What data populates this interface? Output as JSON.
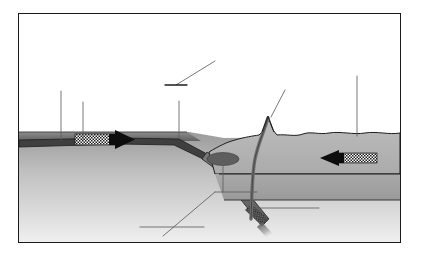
{
  "figure": {
    "number_label": "Fig 27",
    "title": "A destructive plate boundary",
    "frame_color": "#1a1a1a",
    "background_color": "#ffffff"
  },
  "diagram": {
    "name": "destructive-plate-boundary-cross-section",
    "type": "geological-cross-section",
    "palette": {
      "mantle_top": "#9d9d9d",
      "mantle_bottom": "#e8e8e8",
      "ocean_water": "#6f6f6f",
      "oceanic_crust": "#4a4a4a",
      "continental_crust": "#b4b4b4",
      "continental_crust_lower": "#a2a2a2",
      "slab": "#6b6b6b",
      "magma_chamber": "#5e5e5e",
      "conduit": "#6a6a6a",
      "arrow_black": "#0d0d0d",
      "arrow_hatch": "#2a2a2a",
      "leader_line": "#5a5a5a",
      "outline": "#1d1d1d"
    },
    "features": [
      {
        "id": "ocean-water",
        "label": "ocean water layer",
        "description": "dark narrow band of sea water over the oceanic plate on the left"
      },
      {
        "id": "oceanic-plate",
        "label": "oceanic plate",
        "description": "thin dark oceanic crust sloping down to the right toward the trench"
      },
      {
        "id": "ocean-trench",
        "label": "ocean trench",
        "description": "deep V notch where the oceanic plate bends downward"
      },
      {
        "id": "subducting-slab",
        "label": "subducting slab",
        "description": "oceanic plate descending at an angle into the mantle, tip melting"
      },
      {
        "id": "continental-plate",
        "label": "continental plate",
        "description": "thick lighter grey continental crust on the right with an irregular upper surface"
      },
      {
        "id": "magma-chamber",
        "label": "magma chamber",
        "description": "dark grey ellipse of molten rock beneath the volcano"
      },
      {
        "id": "volcano",
        "label": "volcano",
        "description": "conical peak rising from the continental surface"
      },
      {
        "id": "magma-conduit",
        "label": "magma conduit",
        "description": "curved pipe carrying magma from the chamber to the volcano summit"
      },
      {
        "id": "mantle",
        "label": "mantle",
        "description": "pale graded region filling the lower part of the section"
      }
    ],
    "motion_arrows": [
      {
        "id": "oceanic-plate-arrow",
        "label": "oceanic plate movement",
        "direction": "right",
        "style": "solid black head with cross-hatched tail"
      },
      {
        "id": "continental-plate-arrow",
        "label": "continental plate movement",
        "direction": "left",
        "style": "solid black head with cross-hatched tail"
      }
    ],
    "leader_lines": [
      {
        "id": "leader-ocean-surface",
        "target": "ocean water surface"
      },
      {
        "id": "leader-oceanic-plate",
        "target": "oceanic plate"
      },
      {
        "id": "leader-ocean-trench",
        "target": "ocean trench"
      },
      {
        "id": "leader-volcano",
        "target": "volcano summit"
      },
      {
        "id": "leader-continental-plate",
        "target": "continental plate"
      },
      {
        "id": "leader-magma-chamber",
        "target": "magma chamber"
      },
      {
        "id": "leader-slab-melting",
        "target": "melting slab tip"
      },
      {
        "id": "leader-subduction-zone",
        "target": "subduction zone"
      },
      {
        "id": "leader-mantle",
        "target": "mantle"
      }
    ]
  }
}
